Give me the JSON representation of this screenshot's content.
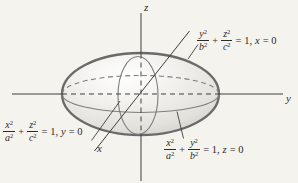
{
  "colors": {
    "bg": "#f4f3ee",
    "text": "#2b2b2b",
    "axis": "#3e3e3e",
    "curve": "#7e7e7e",
    "outline": "#6a6a6a",
    "surf0": "#ffffff",
    "surf1": "#f1f0ec",
    "surf2": "#e2e1dc",
    "surf3": "#cbcac4"
  },
  "axes": {
    "x_label": "x",
    "y_label": "y",
    "z_label": "z"
  },
  "equations": {
    "yz_trace": {
      "num1": "y",
      "den1": "b",
      "num2": "z",
      "den2": "c",
      "exp": "2",
      "plus": "+",
      "eq_part": "= 1,",
      "plane_var": "x",
      "eq_part2": "= 0"
    },
    "xz_trace": {
      "num1": "x",
      "den1": "a",
      "num2": "z",
      "den2": "c",
      "exp": "2",
      "plus": "+",
      "eq_part": "= 1,",
      "plane_var": "y",
      "eq_part2": "= 0"
    },
    "xy_trace": {
      "num1": "x",
      "den1": "a",
      "num2": "y",
      "den2": "b",
      "exp": "2",
      "plus": "+",
      "eq_part": "= 1,",
      "plane_var": "z",
      "eq_part2": "= 0"
    }
  }
}
